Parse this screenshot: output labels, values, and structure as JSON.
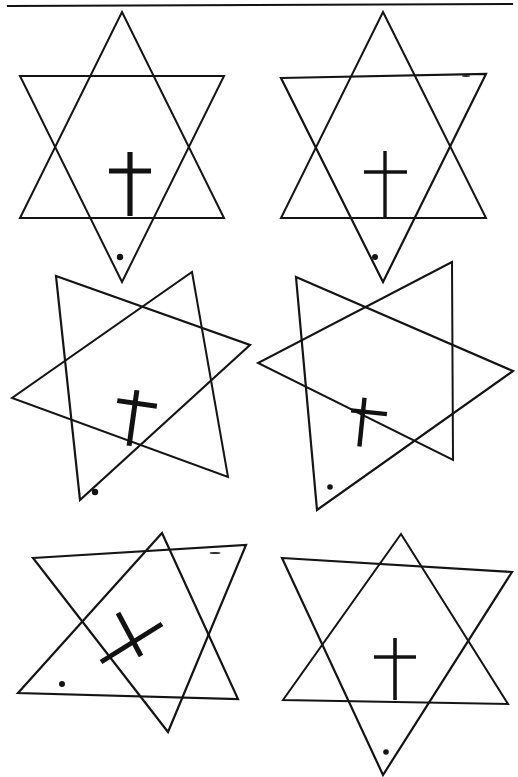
{
  "page": {
    "width": 518,
    "height": 777,
    "background_color": "#ffffff",
    "ink_color": "#141414"
  },
  "header_rule": {
    "name": "top-horizontal-rule",
    "x1": 8,
    "y1": 6,
    "x2": 512,
    "y2": 4,
    "stroke_width": 2.2,
    "color": "#111111"
  },
  "figures": [
    {
      "id": "figure-1",
      "position": "top-left",
      "row": 1,
      "column": 1,
      "star_rotation_deg": 0,
      "cross_rotation_deg": 0,
      "cross_stroke_width": 5.2,
      "center_x": 122,
      "center_y": 130,
      "radius": 118,
      "up_triangle": "122,12 224,218 20,218",
      "down_triangle": "20,76 224,76 122,282",
      "cross": {
        "name": "cross-upright",
        "vertical_x": 130,
        "vertical_y1": 152,
        "vertical_y2": 216,
        "horizontal_y": 171,
        "horizontal_x1": 109,
        "horizontal_x2": 151
      },
      "marker_dot": {
        "cx": 120,
        "cy": 257,
        "r": 3.2
      }
    },
    {
      "id": "figure-2",
      "position": "top-right",
      "row": 1,
      "column": 2,
      "star_rotation_deg": -1,
      "cross_rotation_deg": 0,
      "cross_stroke_width": 3.4,
      "center_x": 383,
      "center_y": 130,
      "radius": 118,
      "up_triangle": "383,12 486,218 281,218",
      "down_triangle": "281,78 486,74 383,282",
      "cross": {
        "name": "cross-upright",
        "vertical_x": 385,
        "vertical_y1": 151,
        "vertical_y2": 217,
        "horizontal_y": 172,
        "horizontal_x1": 364,
        "horizontal_x2": 407
      },
      "marker_dot": {
        "cx": 375,
        "cy": 257,
        "r": 3.0
      }
    },
    {
      "id": "figure-3",
      "position": "middle-left",
      "row": 2,
      "column": 1,
      "star_rotation_deg": 18,
      "cross_rotation_deg": 8,
      "cross_stroke_width": 5.0,
      "center_x": 122,
      "center_y": 385,
      "radius": 118,
      "up_triangle": "192,272 228,477 12,398",
      "down_triangle": "56,276 250,345 80,500",
      "cross": {
        "name": "cross-tilted",
        "vertical_x": 133,
        "vertical_y1": 390,
        "vertical_y2": 446,
        "horizontal_y": 403,
        "horizontal_x1": 115,
        "horizontal_x2": 155
      },
      "marker_dot": {
        "cx": 95,
        "cy": 492,
        "r": 3.2
      }
    },
    {
      "id": "figure-4",
      "position": "middle-right",
      "row": 2,
      "column": 2,
      "star_rotation_deg": 16,
      "cross_rotation_deg": 6,
      "cross_stroke_width": 4.4,
      "center_x": 383,
      "center_y": 385,
      "radius": 118,
      "up_triangle": "452,262 453,460 258,363",
      "down_triangle": "296,277 513,371 317,510",
      "cross": {
        "name": "cross-tilted",
        "vertical_x": 362,
        "vertical_y1": 398,
        "vertical_y2": 447,
        "horizontal_y": 412,
        "horizontal_x1": 350,
        "horizontal_x2": 386
      },
      "marker_dot": {
        "cx": 330,
        "cy": 487,
        "r": 2.8
      }
    },
    {
      "id": "figure-5",
      "position": "bottom-left",
      "row": 3,
      "column": 1,
      "star_rotation_deg": 2,
      "cross_rotation_deg": 62,
      "cross_stroke_width": 5.0,
      "center_x": 132,
      "center_y": 640,
      "radius": 118,
      "up_triangle": "162,533 238,699 18,693",
      "down_triangle": "33,558 246,545 168,732",
      "cross": {
        "name": "cross-rotated",
        "center_x": 130,
        "center_y": 641,
        "long_x1": 101,
        "long_y1": 662,
        "long_x2": 162,
        "long_y2": 624,
        "short_x1": 118,
        "short_y1": 613,
        "short_x2": 141,
        "short_y2": 656
      },
      "marker_dot": {
        "cx": 62,
        "cy": 684,
        "r": 3.0
      }
    },
    {
      "id": "figure-6",
      "position": "bottom-right",
      "row": 3,
      "column": 2,
      "star_rotation_deg": 1,
      "cross_rotation_deg": 0,
      "cross_stroke_width": 3.6,
      "center_x": 395,
      "center_y": 640,
      "radius": 118,
      "up_triangle": "401,534 508,704 283,700",
      "down_triangle": "282,558 512,572 383,775",
      "cross": {
        "name": "cross-upright",
        "vertical_x": 395,
        "vertical_y1": 638,
        "vertical_y2": 700,
        "horizontal_y": 657,
        "horizontal_x1": 374,
        "horizontal_x2": 416
      },
      "marker_dot": {
        "cx": 386,
        "cy": 752,
        "r": 2.8
      }
    }
  ],
  "specks": [
    {
      "cx": 215,
      "cy": 553,
      "rx": 5.5,
      "ry": 1.0
    },
    {
      "cx": 466,
      "cy": 76,
      "rx": 4.0,
      "ry": 0.9
    }
  ]
}
